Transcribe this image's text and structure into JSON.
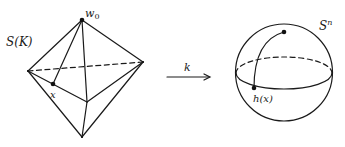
{
  "figure": {
    "left": {
      "name": "octahedron S(K)",
      "label": "S(K)",
      "vertex_label": "w",
      "vertex_subscript": "0",
      "point_label": "x"
    },
    "arrow": {
      "label": "k"
    },
    "right": {
      "name": "sphere S^n",
      "label_base": "S",
      "label_sup": "n",
      "point_label": "h(x)"
    }
  },
  "colors": {
    "ink": "#1a1a1a",
    "background": "#ffffff"
  }
}
